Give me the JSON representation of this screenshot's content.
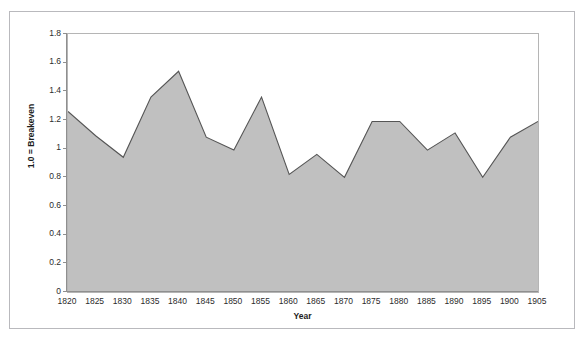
{
  "figure": {
    "top_text_fragment": "",
    "border_color": "#b9b9bd",
    "background": "#ffffff"
  },
  "chart_data": {
    "type": "area",
    "title": "",
    "subtitle": "",
    "xlabel": "Year",
    "ylabel": "1.0 = Breakeven",
    "xlim": [
      1820,
      1905
    ],
    "ylim": [
      0,
      1.8
    ],
    "grid": false,
    "legend": false,
    "legend_position": "none",
    "series_fill_color": "#c0c0c0",
    "series_line_color": "#555555",
    "x": [
      1820,
      1825,
      1830,
      1835,
      1840,
      1845,
      1850,
      1855,
      1860,
      1865,
      1870,
      1875,
      1880,
      1885,
      1890,
      1895,
      1900,
      1905
    ],
    "x_tick_labels": [
      "1820",
      "1825",
      "1830",
      "1835",
      "1840",
      "1845",
      "1850",
      "1855",
      "1860",
      "1865",
      "1870",
      "1875",
      "1880",
      "1885",
      "1890",
      "1895",
      "1900",
      "1905"
    ],
    "y_tick_labels": [
      "0",
      "0.2",
      "0.4",
      "0.6",
      "0.8",
      "1",
      "1.2",
      "1.4",
      "1.6",
      "1.8"
    ],
    "y_ticks": [
      0,
      0.2,
      0.4,
      0.6,
      0.8,
      1.0,
      1.2,
      1.4,
      1.6,
      1.8
    ],
    "series": [
      {
        "name": "Ratio",
        "values": [
          1.26,
          1.09,
          0.94,
          1.36,
          1.54,
          1.08,
          0.99,
          1.36,
          0.82,
          0.96,
          0.8,
          1.19,
          1.19,
          0.99,
          1.11,
          0.8,
          1.08,
          1.19
        ]
      }
    ]
  }
}
